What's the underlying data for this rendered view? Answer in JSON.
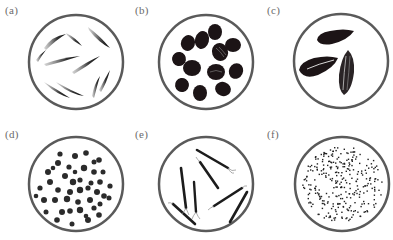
{
  "figure": {
    "colors": {
      "dish_outline": "#5a5a5a",
      "seed_dark": "#1c1416",
      "seed_gray": "#3a3a3a",
      "label": "#6a6a6a",
      "background": "#ffffff"
    },
    "panels": [
      {
        "label": "(a)",
        "seed_type": "thin-curved-elongated",
        "seed_count": 11
      },
      {
        "label": "(b)",
        "seed_type": "large-dark-ovoid",
        "seed_count": 13
      },
      {
        "label": "(c)",
        "seed_type": "striped-sunflower-like",
        "seed_count": 3
      },
      {
        "label": "(d)",
        "seed_type": "small-round",
        "seed_count": 45
      },
      {
        "label": "(e)",
        "seed_type": "needle-like-with-tufts",
        "seed_count": 7
      },
      {
        "label": "(f)",
        "seed_type": "dust-like-tiny",
        "seed_count": 300
      }
    ]
  }
}
